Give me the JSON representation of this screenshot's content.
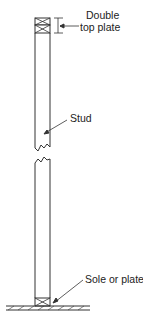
{
  "diagram": {
    "type": "wall-framing-elevation",
    "labels": {
      "top_plate_line1": "Double",
      "top_plate_line2": "top plate",
      "stud": "Stud",
      "sole": "Sole or plate"
    },
    "line_color": "#333333"
  }
}
